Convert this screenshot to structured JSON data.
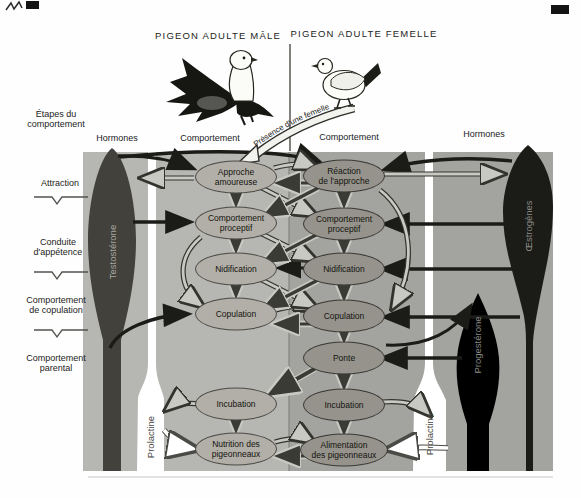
{
  "titles": {
    "male": "PIGEON ADULTE MÂLE",
    "female": "PIGEON ADULTE FEMELLE"
  },
  "headers": {
    "stages": "Étapes du\ncomportement",
    "hormones_left": "Hormones",
    "behavior_left": "Comportement",
    "behavior_right": "Comportement",
    "hormones_right": "Hormones"
  },
  "stages": [
    "Attraction",
    "Conduite\nd'appétence",
    "Comportement\nde copulation",
    "Comportement\nparental"
  ],
  "banner": {
    "label": "Présence d'une femelle"
  },
  "hormones": {
    "testosterone": "Testostérone",
    "estrogens": "Œstrogènes",
    "progesterone": "Progestérone",
    "prolactin_left": "Prolactine",
    "prolactin_right": "Prolactine"
  },
  "male_behaviors": [
    "Approche\namoureuse",
    "Comportement\nproceptif",
    "Nidification",
    "Copulation",
    "Incubation",
    "Nutrition des\npigeonneaux"
  ],
  "female_behaviors": [
    "Réaction\nde l'approche",
    "Comportement\nproceptif",
    "Nidification",
    "Copulation",
    "Ponte",
    "Incubation",
    "Alimentation\ndes pigeonneaux"
  ],
  "colors": {
    "male_panel_bg": "#b6b6b3",
    "female_panel_bg": "#a3a3a0",
    "male_node": "#b2afa8",
    "female_node": "#96938c",
    "dark_hormone": "#42413b",
    "black_hormone": "#1b1b18",
    "white_hormone": "#ffffff",
    "light_arrow": "#c9c9c3"
  }
}
